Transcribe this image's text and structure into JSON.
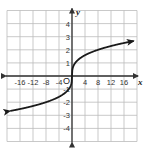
{
  "chart_data": {
    "type": "line",
    "title": "",
    "function": "y = cube_root(x)",
    "xlabel": "x",
    "ylabel": "y",
    "origin_label": "O",
    "xlim": [
      -20,
      20
    ],
    "ylim": [
      -5,
      5
    ],
    "grid": true,
    "x_grid_step": 4,
    "y_grid_step": 1,
    "x_tick_labels": [
      "-16",
      "-12",
      "-8",
      "-4",
      "4",
      "8",
      "12",
      "16"
    ],
    "x_tick_values": [
      -16,
      -12,
      -8,
      -4,
      4,
      8,
      12,
      16
    ],
    "y_tick_labels": [
      "4",
      "3",
      "2",
      "1",
      "-1",
      "-2",
      "-3",
      "-4"
    ],
    "y_tick_values": [
      4,
      3,
      2,
      1,
      -1,
      -2,
      -3,
      -4
    ],
    "series": [
      {
        "name": "f(x)",
        "x": [
          -19,
          -16,
          -12,
          -8,
          -4,
          -1,
          0,
          1,
          4,
          8,
          12,
          16,
          19
        ],
        "y": [
          -2.67,
          -2.52,
          -2.29,
          -2.0,
          -1.59,
          -1.0,
          0,
          1.0,
          1.59,
          2.0,
          2.29,
          2.52,
          2.67
        ],
        "arrows": "both ends"
      }
    ],
    "colors": {
      "curve": "#1a1a1a",
      "axes": "#333333",
      "grid": "#bbbbbb"
    }
  }
}
